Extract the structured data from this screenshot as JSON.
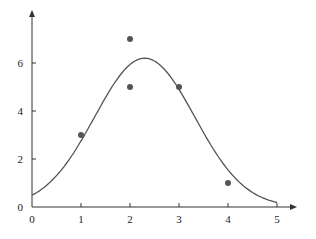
{
  "chart_data": {
    "type": "scatter",
    "title": "",
    "xlabel": "",
    "ylabel": "",
    "xlim": [
      0,
      5
    ],
    "ylim": [
      0,
      7
    ],
    "grid": false,
    "legend": null,
    "x_ticks": [
      0,
      1,
      2,
      3,
      4,
      5
    ],
    "y_ticks": [
      0,
      2,
      4,
      6
    ],
    "series": [
      {
        "name": "data points",
        "kind": "scatter",
        "points": [
          {
            "x": 1,
            "y": 3
          },
          {
            "x": 2,
            "y": 7
          },
          {
            "x": 2,
            "y": 5
          },
          {
            "x": 3,
            "y": 5
          },
          {
            "x": 4,
            "y": 1
          }
        ]
      },
      {
        "name": "fitted curve",
        "kind": "line",
        "description": "Bell-shaped (Gaussian-like) fitted curve peaking near x=2.3, y=6.2",
        "params": {
          "amplitude": 6.2,
          "mean": 2.3,
          "sigma": 1.02
        },
        "points": [
          {
            "x": 0,
            "y": 0.55
          },
          {
            "x": 1,
            "y": 2.8
          },
          {
            "x": 2,
            "y": 5.9
          },
          {
            "x": 2.3,
            "y": 6.2
          },
          {
            "x": 3,
            "y": 4.9
          },
          {
            "x": 4,
            "y": 1.6
          },
          {
            "x": 5,
            "y": 0.15
          }
        ]
      }
    ]
  },
  "colors": {
    "axis": "#333333",
    "curve": "#555555",
    "points": "#555555",
    "text": "#222222"
  }
}
